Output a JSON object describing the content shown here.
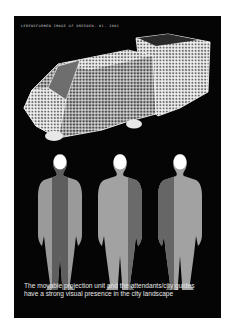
{
  "page": {
    "header_text": "Lebensformen Image of Dresden. 01. 2001",
    "caption_line1": "The movable projection unit and the attendants/city guides",
    "caption_line2": "have a strong visual presence in the city landscape",
    "colors": {
      "background": "#ffffff",
      "panel": "#050505",
      "vehicle_grid": "#e0e0e0",
      "windshield": "#6e6e6e",
      "figure_light": "#9a9a9a",
      "figure_dark": "#5e5e5e",
      "head": "#ffffff"
    }
  },
  "illustration": {
    "vehicle": {
      "label": "projection-unit",
      "style": "halftone-grid"
    },
    "figures": [
      {
        "label": "attendant-1",
        "dark_half": "center"
      },
      {
        "label": "attendant-2",
        "dark_half": "right"
      },
      {
        "label": "attendant-3",
        "dark_half": "left"
      }
    ]
  }
}
